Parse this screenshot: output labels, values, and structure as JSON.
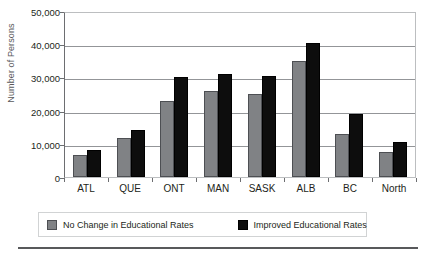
{
  "chart_data": {
    "type": "bar",
    "title": "",
    "xlabel": "",
    "ylabel": "Number of Persons",
    "categories": [
      "ATL",
      "QUE",
      "ONT",
      "MAN",
      "SASK",
      "ALB",
      "BC",
      "North"
    ],
    "series": [
      {
        "name": "No Change in Educational Rates",
        "color": "#808285",
        "values": [
          6500,
          11800,
          23000,
          26000,
          25000,
          35000,
          13000,
          7500
        ]
      },
      {
        "name": "Improved Educational Rates",
        "color": "#0d0d0d",
        "values": [
          8200,
          14300,
          30000,
          31000,
          30500,
          40500,
          19000,
          10500
        ]
      }
    ],
    "ylim": [
      0,
      50000
    ],
    "y_ticks": [
      0,
      10000,
      20000,
      30000,
      40000,
      50000
    ],
    "y_tick_labels": [
      "0",
      "10,000",
      "20,000",
      "30,000",
      "40,000",
      "50,000"
    ],
    "grid": "horizontal",
    "legend_position": "bottom"
  }
}
